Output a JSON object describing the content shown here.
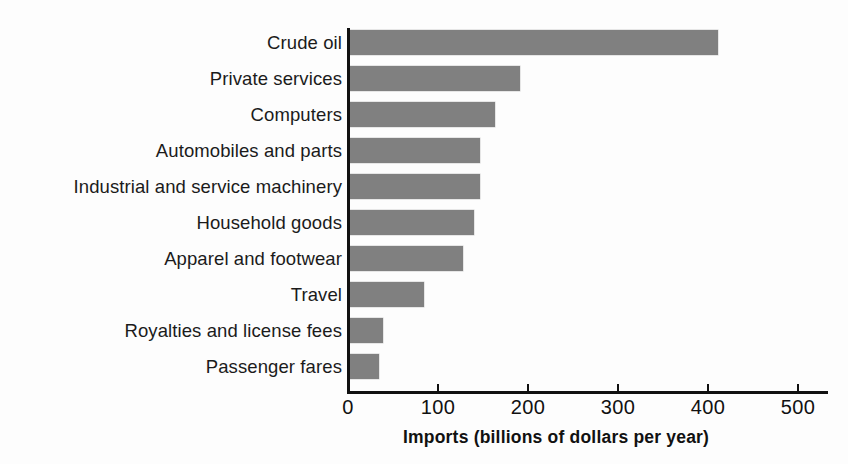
{
  "chart_data": {
    "type": "bar",
    "orientation": "horizontal",
    "title": "",
    "subtitle": "",
    "xlabel": "Imports (billions of dollars per year)",
    "ylabel": "",
    "categories": [
      "Crude oil",
      "Private services",
      "Computers",
      "Automobiles and parts",
      "Industrial and service machinery",
      "Household goods",
      "Apparel and footwear",
      "Travel",
      "Royalties and license fees",
      "Passenger fares"
    ],
    "values": [
      410,
      190,
      162,
      145,
      145,
      139,
      127,
      83,
      38,
      33
    ],
    "xlim": [
      0,
      540
    ],
    "xticks": [
      0,
      100,
      200,
      300,
      400,
      500
    ],
    "xtick_labels": [
      "0",
      "100",
      "200",
      "300",
      "400",
      "500"
    ],
    "grid": false,
    "legend": false,
    "bar_color": "#808080",
    "axis_color": "#111111",
    "text_color": "#1b1b1b",
    "background_color": "#fdfdfd"
  }
}
